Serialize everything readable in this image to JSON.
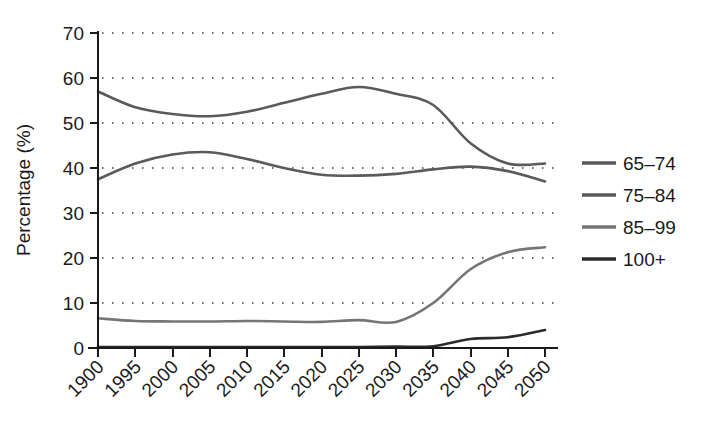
{
  "chart_data": {
    "type": "line",
    "title": "",
    "xlabel": "",
    "ylabel": "Percentage (%)",
    "ylim": [
      0,
      70
    ],
    "ytick_step": 10,
    "yticks": [
      "0",
      "10",
      "20",
      "30",
      "40",
      "50",
      "60",
      "70"
    ],
    "grid": true,
    "grid_style": "dotted-horizontal",
    "legend_position": "right",
    "categories": [
      "1900",
      "1995",
      "2000",
      "2005",
      "2010",
      "2015",
      "2020",
      "2025",
      "2030",
      "2035",
      "2040",
      "2045",
      "2050"
    ],
    "series": [
      {
        "name": "65–74",
        "color": "#5a5a5a",
        "values": [
          57.0,
          53.5,
          52.0,
          51.5,
          52.5,
          54.5,
          56.5,
          58.0,
          56.5,
          54.0,
          45.5,
          41.0,
          41.0
        ]
      },
      {
        "name": "75–84",
        "color": "#5a5a5a",
        "values": [
          37.5,
          41.0,
          43.0,
          43.5,
          42.0,
          40.0,
          38.5,
          38.3,
          38.7,
          39.7,
          40.3,
          39.3,
          37.0
        ]
      },
      {
        "name": "85–99",
        "color": "#757575",
        "values": [
          6.6,
          6.0,
          5.9,
          5.9,
          6.0,
          5.9,
          5.8,
          6.2,
          5.8,
          10.0,
          17.5,
          21.3,
          22.4
        ]
      },
      {
        "name": "100+",
        "color": "#2b2b2b",
        "values": [
          0.2,
          0.2,
          0.2,
          0.2,
          0.2,
          0.2,
          0.2,
          0.2,
          0.3,
          0.4,
          2.0,
          2.4,
          4.0
        ]
      }
    ]
  },
  "legend": {
    "items": [
      {
        "label": "65–74"
      },
      {
        "label": "75–84"
      },
      {
        "label": "85–99"
      },
      {
        "label": "100+"
      }
    ]
  },
  "axes": {
    "y_title": "Percentage (%)"
  }
}
